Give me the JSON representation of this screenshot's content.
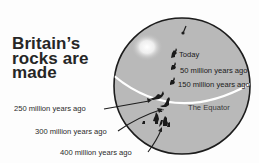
{
  "title": {
    "lines": [
      "Britain’s",
      "rocks are",
      "made"
    ]
  },
  "globe": {
    "fill_color": "#b8b8b8",
    "outline_color": "#1e1e1e",
    "equator_color": "#ffffff",
    "highlight_color": "#f2f2f2"
  },
  "labels": {
    "today": "Today",
    "m50": "50 million years ago",
    "m150": "150 million years ago",
    "equator": "The Equator",
    "m250": "250 million years ago",
    "m300": "300 million years ago",
    "m400": "400 million years ago"
  },
  "icons": {
    "britain_positions": [
      "britain-today",
      "britain-50m",
      "britain-150m",
      "britain-250m",
      "britain-300m",
      "britain-400m"
    ],
    "north_pole_marker": "pole-pin"
  }
}
